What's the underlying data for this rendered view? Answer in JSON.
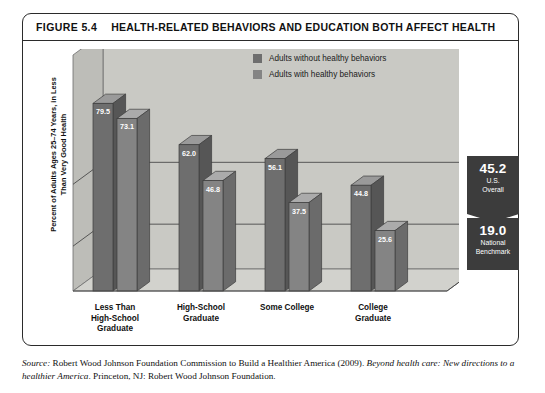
{
  "figure": {
    "number": "FIGURE 5.4",
    "title": "HEALTH-RELATED BEHAVIORS AND EDUCATION BOTH AFFECT HEALTH"
  },
  "source": {
    "prefix": "Source:",
    "line1_roman_a": " Robert Wood Johnson Foundation Commission to Build a Healthier America (2009). ",
    "line1_italic": "Beyond health",
    "line2_italic": "care: New directions to a healthier America",
    "line2_roman": ". Princeton, NJ: Robert Wood Johnson Foundation."
  },
  "benchmarks": [
    {
      "value": "45.2",
      "label_line1": "U.S.",
      "label_line2": "Overall"
    },
    {
      "value": "19.0",
      "label_line1": "National",
      "label_line2": "Benchmark"
    }
  ],
  "colors": {
    "series_without": "#6e6e6e",
    "series_with": "#848484",
    "plot_floor": "#d2d2cd",
    "plot_back": "#c9c9c4",
    "benchmark_box": "#3c3c3c",
    "frame": "#2b2b2b"
  },
  "chart_data": {
    "type": "bar",
    "title": "HEALTH-RELATED BEHAVIORS AND EDUCATION BOTH AFFECT HEALTH",
    "xlabel": "",
    "ylabel": "Percent of Adults Ages 25–74 Years, in Less Than Very Good Health",
    "ylim": [
      0,
      100
    ],
    "grid": true,
    "gridlines": [
      45.2,
      19.0
    ],
    "legend_position": "top-right",
    "categories": [
      "Less Than High-School Graduate",
      "High-School Graduate",
      "Some College",
      "College Graduate"
    ],
    "category_label_lines": [
      [
        "Less Than",
        "High-School",
        "Graduate"
      ],
      [
        "High-School",
        "Graduate"
      ],
      [
        "Some College"
      ],
      [
        "College",
        "Graduate"
      ]
    ],
    "series": [
      {
        "name": "Adults without healthy behaviors",
        "values": [
          79.5,
          62.0,
          56.1,
          44.8
        ]
      },
      {
        "name": "Adults with healthy behaviors",
        "values": [
          73.1,
          46.8,
          37.5,
          25.6
        ]
      }
    ],
    "annotations": [
      {
        "value": 45.2,
        "text": "U.S. Overall"
      },
      {
        "value": 19.0,
        "text": "National Benchmark"
      }
    ]
  }
}
